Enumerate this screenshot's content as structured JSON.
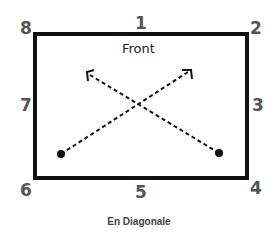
{
  "diagram": {
    "front_label": "Front",
    "caption": "En Diagonale",
    "positions": [
      {
        "id": "1",
        "label": "1"
      },
      {
        "id": "2",
        "label": "2"
      },
      {
        "id": "3",
        "label": "3"
      },
      {
        "id": "4",
        "label": "4"
      },
      {
        "id": "5",
        "label": "5"
      },
      {
        "id": "6",
        "label": "6"
      },
      {
        "id": "7",
        "label": "7"
      },
      {
        "id": "8",
        "label": "8"
      }
    ],
    "paths": [
      {
        "from": "bottom-left",
        "to": "top-right",
        "style": "dashed-arrow"
      },
      {
        "from": "bottom-right",
        "to": "top-left",
        "style": "dashed-arrow"
      }
    ]
  }
}
